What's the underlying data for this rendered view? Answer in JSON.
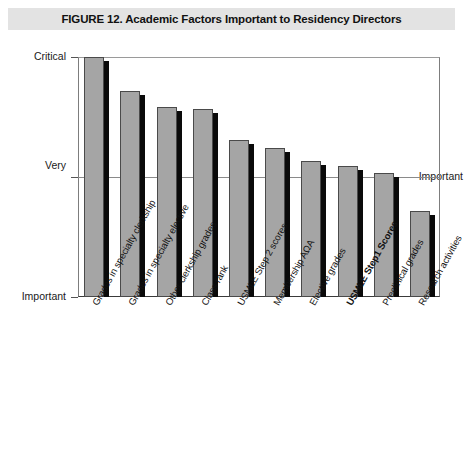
{
  "figure": {
    "banner_title": "FIGURE 12. Academic Factors Important to Residency Directors"
  },
  "axis": {
    "y_labels": {
      "top": "Critical",
      "middle_line1": "Very",
      "middle_line2": "Important",
      "bottom": "Important"
    }
  },
  "chart_data": {
    "type": "bar",
    "title": "FIGURE 12. Academic Factors Important to Residency Directors",
    "xlabel": "",
    "ylabel": "",
    "grid": true,
    "legend": "none",
    "ylim": [
      1,
      3
    ],
    "ytick_labels": [
      "Important",
      "Very Important",
      "Critical"
    ],
    "ytick_values": [
      1,
      2,
      3
    ],
    "categories": [
      "Grades in specialty clerkship",
      "Grades in specialty elective",
      "Other clerkship grades",
      "Class rank",
      "USMLE Step 2 scores",
      "Membership AΩA",
      "Elective grades",
      "USMLE Step1 Scores",
      "Preclinical grades",
      "Research activities"
    ],
    "values": [
      3.0,
      2.72,
      2.58,
      2.57,
      2.31,
      2.24,
      2.13,
      2.09,
      2.03,
      1.72
    ],
    "highlighted_category": "USMLE Step1 Scores",
    "bar_fill_color": "#a5a5a5",
    "bar_edge_color": "#4a4a4a",
    "bar_shadow_color": "#0a0a0a"
  }
}
